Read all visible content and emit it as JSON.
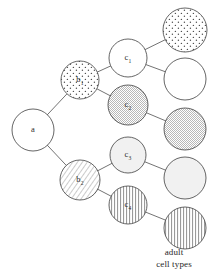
{
  "figure": {
    "type": "cell-lineage-tree",
    "background_color": "#ffffff",
    "stroke_color": "#4a4a4a",
    "edge_color": "#5a5a5a",
    "label_color": "#2b2b2b"
  },
  "caption": {
    "line1": "adult",
    "line2": "cell types"
  },
  "nodes": [
    {
      "id": "a",
      "label_main": "a",
      "label_sub": "",
      "cx": 33,
      "cy": 130,
      "r": 21,
      "fill": "none",
      "fill_name": "white-empty",
      "generation": 0,
      "name": "node-a"
    },
    {
      "id": "b1",
      "label_main": "b",
      "label_sub": "1",
      "cx": 80,
      "cy": 80,
      "r": 19,
      "fill": "sparse-dots",
      "fill_name": "sparse-stipple",
      "generation": 1,
      "name": "node-b1"
    },
    {
      "id": "b2",
      "label_main": "b",
      "label_sub": "2",
      "cx": 80,
      "cy": 180,
      "r": 20,
      "fill": "diagonal-hatch",
      "fill_name": "diagonal-lines",
      "generation": 1,
      "name": "node-b2"
    },
    {
      "id": "c1",
      "label_main": "c",
      "label_sub": "1",
      "cx": 128,
      "cy": 58,
      "r": 19,
      "fill": "none",
      "fill_name": "white-empty",
      "generation": 2,
      "name": "node-c1"
    },
    {
      "id": "c2",
      "label_main": "c",
      "label_sub": "2",
      "cx": 128,
      "cy": 105,
      "r": 20,
      "fill": "dense-stipple",
      "fill_name": "dense-stipple",
      "generation": 2,
      "name": "node-c2"
    },
    {
      "id": "c3",
      "label_main": "c",
      "label_sub": "3",
      "cx": 128,
      "cy": 155,
      "r": 18,
      "fill": "light-gray",
      "fill_name": "pale-gray",
      "generation": 2,
      "name": "node-c3"
    },
    {
      "id": "c4",
      "label_main": "c",
      "label_sub": "4",
      "cx": 128,
      "cy": 205,
      "r": 19,
      "fill": "vertical-hatch",
      "fill_name": "vertical-lines",
      "generation": 2,
      "name": "node-c4"
    },
    {
      "id": "t1",
      "label_main": "",
      "label_sub": "",
      "cx": 185,
      "cy": 30,
      "r": 22,
      "fill": "sparse-dots",
      "fill_name": "sparse-stipple",
      "generation": 3,
      "name": "node-terminal-1"
    },
    {
      "id": "t2",
      "label_main": "",
      "label_sub": "",
      "cx": 185,
      "cy": 79,
      "r": 21,
      "fill": "none",
      "fill_name": "white-empty",
      "generation": 3,
      "name": "node-terminal-2"
    },
    {
      "id": "t3",
      "label_main": "",
      "label_sub": "",
      "cx": 185,
      "cy": 129,
      "r": 21,
      "fill": "dense-stipple",
      "fill_name": "dense-stipple",
      "generation": 3,
      "name": "node-terminal-3"
    },
    {
      "id": "t4",
      "label_main": "",
      "label_sub": "",
      "cx": 185,
      "cy": 178,
      "r": 21,
      "fill": "light-gray",
      "fill_name": "pale-gray",
      "generation": 3,
      "name": "node-terminal-4"
    },
    {
      "id": "t5",
      "label_main": "",
      "label_sub": "",
      "cx": 185,
      "cy": 228,
      "r": 21,
      "fill": "vertical-hatch",
      "fill_name": "vertical-lines",
      "generation": 3,
      "name": "node-terminal-5"
    }
  ],
  "edges": [
    {
      "from": "a",
      "to": "b1",
      "name": "edge-a-b1"
    },
    {
      "from": "a",
      "to": "b2",
      "name": "edge-a-b2"
    },
    {
      "from": "b1",
      "to": "c1",
      "name": "edge-b1-c1"
    },
    {
      "from": "b1",
      "to": "c2",
      "name": "edge-b1-c2"
    },
    {
      "from": "b2",
      "to": "c3",
      "name": "edge-b2-c3"
    },
    {
      "from": "b2",
      "to": "c4",
      "name": "edge-b2-c4"
    },
    {
      "from": "c1",
      "to": "t1",
      "name": "edge-c1-t1"
    },
    {
      "from": "c1",
      "to": "t2",
      "name": "edge-c1-t2"
    },
    {
      "from": "c2",
      "to": "t3",
      "name": "edge-c2-t3"
    },
    {
      "from": "c3",
      "to": "t4",
      "name": "edge-c3-t4"
    },
    {
      "from": "c4",
      "to": "t5",
      "name": "edge-c4-t5"
    }
  ]
}
